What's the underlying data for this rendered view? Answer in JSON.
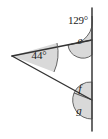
{
  "figure": {
    "colors": {
      "line": "#333333",
      "sector_fill": "#d9d9d9",
      "sector_stroke": "#555555",
      "background": "#ffffff",
      "text": "#1a1a1a"
    },
    "labels": {
      "apex_angle": "44°",
      "top_angle": "129°",
      "angle_e": "e",
      "angle_f": "f",
      "angle_g": "g"
    },
    "geometry": {
      "vertex": {
        "x": 12,
        "y": 56
      },
      "vertical_line": {
        "x": 92,
        "y_top": 8,
        "y_bottom": 131
      },
      "upper_intersection": {
        "x": 92,
        "y": 40
      },
      "lower_intersection": {
        "x": 92,
        "y": 100
      }
    }
  }
}
